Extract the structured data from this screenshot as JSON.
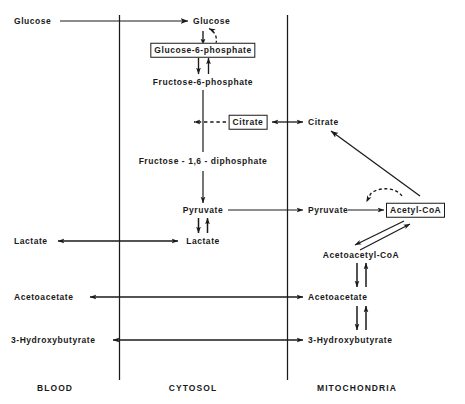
{
  "figure": {
    "colors": {
      "line": "#1a1a1a",
      "text": "#1a1a1a",
      "background": "#ffffff",
      "faint_caption": "#b9b9b9"
    }
  },
  "compartments": [
    {
      "id": "blood",
      "label": "BLOOD"
    },
    {
      "id": "cytosol",
      "label": "CYTOSOL"
    },
    {
      "id": "mitochondria",
      "label": "MITOCHONDRIA"
    }
  ],
  "metabolites": {
    "blood": [
      {
        "id": "blood-glucose",
        "label": "Glucose",
        "boxed": false
      },
      {
        "id": "blood-lactate",
        "label": "Lactate",
        "boxed": false
      },
      {
        "id": "blood-acetoacetate",
        "label": "Acetoacetate",
        "boxed": false
      },
      {
        "id": "blood-3-hydroxybutyrate",
        "label": "3-Hydroxybutyrate",
        "boxed": false
      }
    ],
    "cytosol": [
      {
        "id": "cytosol-glucose",
        "label": "Glucose",
        "boxed": false
      },
      {
        "id": "glucose-6-phosphate",
        "label": "Glucose-6-phosphate",
        "boxed": true
      },
      {
        "id": "fructose-6-phosphate",
        "label": "Fructose-6-phosphate",
        "boxed": false
      },
      {
        "id": "cytosol-citrate",
        "label": "Citrate",
        "boxed": true
      },
      {
        "id": "fructose-1-6-diphosphate",
        "label": "Fructose - 1,6 - diphosphate",
        "boxed": false
      },
      {
        "id": "cytosol-pyruvate",
        "label": "Pyruvate",
        "boxed": false
      },
      {
        "id": "cytosol-lactate",
        "label": "Lactate",
        "boxed": false
      }
    ],
    "mitochondria": [
      {
        "id": "mito-citrate",
        "label": "Citrate",
        "boxed": false
      },
      {
        "id": "mito-pyruvate",
        "label": "Pyruvate",
        "boxed": false
      },
      {
        "id": "acetyl-coa",
        "label": "Acetyl-CoA",
        "boxed": true
      },
      {
        "id": "acetoacetyl-coa",
        "label": "Acetoacetyl-CoA",
        "boxed": false
      },
      {
        "id": "mito-acetoacetate",
        "label": "Acetoacetate",
        "boxed": false
      },
      {
        "id": "mito-3-hydroxybutyrate",
        "label": "3-Hydroxybutyrate",
        "boxed": false
      }
    ]
  },
  "reactions": [
    {
      "id": "blood-glucose-to-cytosol-glucose",
      "from": "blood-glucose",
      "to": "cytosol-glucose",
      "style": "solid",
      "direction": "forward"
    },
    {
      "id": "cytosol-glucose-to-g6p",
      "from": "cytosol-glucose",
      "to": "glucose-6-phosphate",
      "style": "solid",
      "direction": "forward"
    },
    {
      "id": "g6p-to-cytosol-glucose-feedback",
      "from": "glucose-6-phosphate",
      "to": "cytosol-glucose",
      "style": "dashed-curve",
      "direction": "forward"
    },
    {
      "id": "g6p-to-f6p",
      "from": "glucose-6-phosphate",
      "to": "fructose-6-phosphate",
      "style": "solid",
      "direction": "reversible"
    },
    {
      "id": "f6p-to-fdp",
      "from": "fructose-6-phosphate",
      "to": "fructose-1-6-diphosphate",
      "style": "solid",
      "direction": "forward"
    },
    {
      "id": "cytosol-citrate-inhibits-pfk",
      "from": "cytosol-citrate",
      "to": "fructose-6-phosphate-pathway",
      "style": "dashed",
      "direction": "forward"
    },
    {
      "id": "mito-citrate-to-cytosol-citrate",
      "from": "mito-citrate",
      "to": "cytosol-citrate",
      "style": "solid",
      "direction": "forward"
    },
    {
      "id": "fdp-to-cytosol-pyruvate",
      "from": "fructose-1-6-diphosphate",
      "to": "cytosol-pyruvate",
      "style": "solid",
      "direction": "forward"
    },
    {
      "id": "cytosol-pyruvate-to-mito-pyruvate",
      "from": "cytosol-pyruvate",
      "to": "mito-pyruvate",
      "style": "solid",
      "direction": "forward"
    },
    {
      "id": "cytosol-pyruvate-lactate",
      "from": "cytosol-pyruvate",
      "to": "cytosol-lactate",
      "style": "solid",
      "direction": "reversible"
    },
    {
      "id": "cytosol-lactate-to-blood-lactate",
      "from": "cytosol-lactate",
      "to": "blood-lactate",
      "style": "solid",
      "direction": "reversible"
    },
    {
      "id": "mito-pyruvate-to-acetyl-coa",
      "from": "mito-pyruvate",
      "to": "acetyl-coa",
      "style": "solid",
      "direction": "forward"
    },
    {
      "id": "acetyl-coa-inhibits-pdh",
      "from": "acetyl-coa",
      "to": "mito-pyruvate-to-acetyl-coa",
      "style": "dashed-curve",
      "direction": "forward"
    },
    {
      "id": "acetyl-coa-to-mito-citrate",
      "from": "acetyl-coa",
      "to": "mito-citrate",
      "style": "solid",
      "direction": "forward"
    },
    {
      "id": "acetyl-coa-acetoacetyl-coa",
      "from": "acetyl-coa",
      "to": "acetoacetyl-coa",
      "style": "solid",
      "direction": "reversible"
    },
    {
      "id": "acetoacetyl-coa-to-mito-acetoacetate",
      "from": "acetoacetyl-coa",
      "to": "mito-acetoacetate",
      "style": "solid",
      "direction": "reversible"
    },
    {
      "id": "mito-acetoacetate-to-blood-acetoacetate",
      "from": "mito-acetoacetate",
      "to": "blood-acetoacetate",
      "style": "solid",
      "direction": "reversible"
    },
    {
      "id": "mito-acetoacetate-3-hydroxybutyrate",
      "from": "mito-acetoacetate",
      "to": "mito-3-hydroxybutyrate",
      "style": "solid",
      "direction": "reversible"
    },
    {
      "id": "mito-3hb-to-blood-3hb",
      "from": "mito-3-hydroxybutyrate",
      "to": "blood-3-hydroxybutyrate",
      "style": "solid",
      "direction": "reversible"
    }
  ]
}
